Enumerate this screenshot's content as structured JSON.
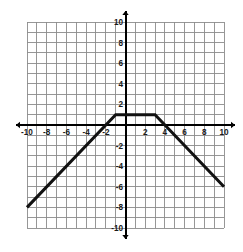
{
  "chart_data": {
    "type": "line",
    "title": "",
    "xlabel": "",
    "ylabel": "",
    "xlim": [
      -10,
      10
    ],
    "ylim": [
      -10,
      10
    ],
    "grid": true,
    "grid_step": 1,
    "legend": "none",
    "axis_arrows": true,
    "xticks": [
      -10,
      -8,
      -6,
      -4,
      -2,
      2,
      4,
      6,
      8,
      10
    ],
    "yticks": [
      10,
      8,
      6,
      4,
      2,
      -2,
      -4,
      -6,
      -8,
      -10
    ],
    "xtick_labels": [
      "-10",
      "-8",
      "-6",
      "-4",
      "-2",
      "2",
      "4",
      "6",
      "8",
      "10"
    ],
    "ytick_labels": [
      "10",
      "8",
      "6",
      "4",
      "2",
      "-2",
      "-4",
      "-6",
      "-8",
      "-10"
    ],
    "series": [
      {
        "name": "piecewise-linear-function",
        "color": "#111111",
        "linewidth": 3,
        "points": [
          {
            "x": -10,
            "y": -8
          },
          {
            "x": -1,
            "y": 1
          },
          {
            "x": 3,
            "y": 1
          },
          {
            "x": 10,
            "y": -6
          }
        ],
        "segments": [
          {
            "from": [
              -10,
              -8
            ],
            "to": [
              -1,
              1
            ],
            "slope": 1
          },
          {
            "from": [
              -1,
              1
            ],
            "to": [
              3,
              1
            ],
            "slope": 0
          },
          {
            "from": [
              3,
              1
            ],
            "to": [
              10,
              -6
            ],
            "slope": -1
          }
        ]
      }
    ]
  },
  "colors": {
    "grid": "#8c8c8c",
    "axis": "#000000",
    "curve": "#111111",
    "background": "#ffffff",
    "tick_text": "#1a1a1a"
  }
}
